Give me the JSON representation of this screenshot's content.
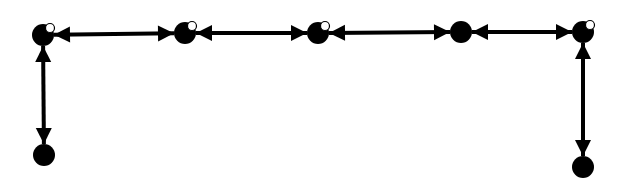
{
  "diagram": {
    "type": "graph",
    "colors": {
      "node": "#000000",
      "edge": "#000000",
      "highlight": "#ffffff",
      "background": "#ffffff"
    },
    "nodes": [
      {
        "id": "n1",
        "x": 43,
        "y": 35,
        "r": 11,
        "highlight": true
      },
      {
        "id": "n2",
        "x": 185,
        "y": 33,
        "r": 11,
        "highlight": true
      },
      {
        "id": "n3",
        "x": 318,
        "y": 33,
        "r": 11,
        "highlight": true
      },
      {
        "id": "n4",
        "x": 461,
        "y": 32,
        "r": 11,
        "highlight": false
      },
      {
        "id": "n5",
        "x": 583,
        "y": 32,
        "r": 11,
        "highlight": true
      },
      {
        "id": "n6",
        "x": 44,
        "y": 155,
        "r": 11,
        "highlight": false
      },
      {
        "id": "n7",
        "x": 583,
        "y": 167,
        "r": 11,
        "highlight": false
      }
    ],
    "edges": [
      {
        "from": "n1",
        "to": "n2",
        "arrows": "both"
      },
      {
        "from": "n2",
        "to": "n3",
        "arrows": "both"
      },
      {
        "from": "n3",
        "to": "n4",
        "arrows": "both"
      },
      {
        "from": "n4",
        "to": "n5",
        "arrows": "both"
      },
      {
        "from": "n1",
        "to": "n6",
        "arrows": "both"
      },
      {
        "from": "n5",
        "to": "n7",
        "arrows": "both"
      }
    ]
  }
}
